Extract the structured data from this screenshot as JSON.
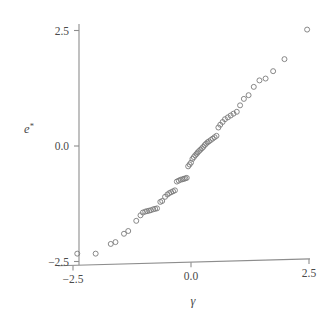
{
  "chart_data": {
    "type": "scatter",
    "title": "",
    "subtitle": "",
    "xlabel": "γ",
    "ylabel": "e*",
    "xlabel_plain": "gamma",
    "ylabel_plain": "e-star",
    "xlim": [
      -2.9,
      2.75
    ],
    "ylim": [
      -2.75,
      2.9
    ],
    "xticks": [
      -2.5,
      0.0,
      2.5
    ],
    "xticklabels": [
      "−2.5",
      "0.0",
      "2.5"
    ],
    "yticks": [
      -2.5,
      0.0,
      2.5
    ],
    "yticklabels": [
      "−2.5",
      "0.0",
      "2.5"
    ],
    "grid": false,
    "legend": null,
    "marker": "open-circle",
    "marker_color": "#7a7a7a",
    "axis_color": "#8d8d8d",
    "text_color": "#4a4a4a",
    "background": "#ffffff",
    "n_points": 68,
    "x": [
      -2.41,
      -2.02,
      -1.7,
      -1.6,
      -1.42,
      -1.33,
      -1.16,
      -1.07,
      -1.02,
      -0.97,
      -0.93,
      -0.89,
      -0.85,
      -0.8,
      -0.76,
      -0.72,
      -0.65,
      -0.61,
      -0.55,
      -0.5,
      -0.46,
      -0.42,
      -0.38,
      -0.34,
      -0.3,
      -0.26,
      -0.22,
      -0.18,
      -0.15,
      -0.12,
      -0.09,
      -0.06,
      -0.03,
      0.0,
      0.03,
      0.06,
      0.09,
      0.12,
      0.14,
      0.17,
      0.2,
      0.23,
      0.26,
      0.29,
      0.32,
      0.35,
      0.38,
      0.42,
      0.46,
      0.5,
      0.54,
      0.58,
      0.62,
      0.67,
      0.72,
      0.78,
      0.84,
      0.9,
      0.97,
      1.04,
      1.12,
      1.22,
      1.33,
      1.45,
      1.58,
      1.74,
      1.98,
      2.46
    ],
    "y": [
      -2.33,
      -2.33,
      -2.12,
      -2.08,
      -1.9,
      -1.84,
      -1.62,
      -1.5,
      -1.44,
      -1.42,
      -1.41,
      -1.4,
      -1.39,
      -1.37,
      -1.36,
      -1.35,
      -1.21,
      -1.19,
      -1.1,
      -1.05,
      -1.02,
      -1.0,
      -0.98,
      -0.96,
      -0.77,
      -0.75,
      -0.73,
      -0.72,
      -0.71,
      -0.7,
      -0.69,
      -0.44,
      -0.4,
      -0.36,
      -0.28,
      -0.24,
      -0.2,
      -0.17,
      -0.14,
      -0.11,
      -0.08,
      -0.05,
      -0.02,
      0.02,
      0.05,
      0.08,
      0.1,
      0.13,
      0.16,
      0.19,
      0.22,
      0.4,
      0.46,
      0.52,
      0.58,
      0.62,
      0.66,
      0.7,
      0.74,
      0.88,
      1.02,
      1.1,
      1.28,
      1.42,
      1.46,
      1.62,
      1.88,
      2.52
    ]
  }
}
